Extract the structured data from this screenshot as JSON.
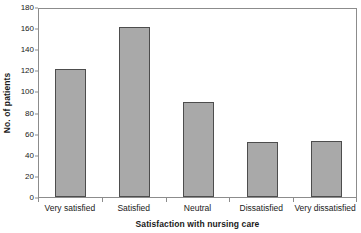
{
  "chart_data": {
    "type": "bar",
    "title": "",
    "subtitle": "",
    "xlabel": "Satisfaction with nursing care",
    "ylabel": "No. of patients",
    "categories": [
      "Very satisfied",
      "Satisfied",
      "Neutral",
      "Dissatisfied",
      "Very dissatisfied"
    ],
    "values": [
      121,
      161,
      90,
      52,
      53
    ],
    "ylim": [
      0,
      180
    ],
    "ytick_values": [
      0,
      20,
      40,
      60,
      80,
      100,
      120,
      140,
      160,
      180
    ],
    "ytick_labels": [
      "0",
      "20",
      "40",
      "60",
      "80",
      "100",
      "120",
      "140",
      "160",
      "180"
    ],
    "grid": false,
    "legend": null,
    "legend_position": "none",
    "bar_fill_color": "#a9a9a9",
    "bar_border_color": "#4d4d4d",
    "axis_color": "#8c8c8c",
    "background_color": "#ffffff",
    "annotations": []
  }
}
